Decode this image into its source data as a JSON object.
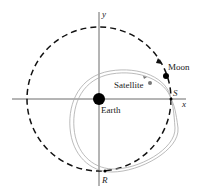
{
  "diagram": {
    "axes": {
      "x_label": "x",
      "y_label": "y"
    },
    "labels": {
      "earth": "Earth",
      "moon": "Moon",
      "satellite": "Satellite",
      "point_s": "S",
      "point_r": "R"
    },
    "colors": {
      "axis": "#333333",
      "moon_orbit": "#111111",
      "satellite_orbit": "#aaaaaa",
      "earth": "#000000",
      "satellite": "#777777"
    }
  }
}
